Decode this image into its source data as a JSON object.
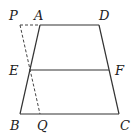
{
  "figure": {
    "type": "geometry-trapezoid",
    "points": {
      "P": {
        "label": "P",
        "x": 20,
        "y": 25,
        "lx": 9,
        "ly": 20
      },
      "A": {
        "label": "A",
        "x": 40,
        "y": 25,
        "lx": 34,
        "ly": 20
      },
      "D": {
        "label": "D",
        "x": 99,
        "y": 25,
        "lx": 99,
        "ly": 20
      },
      "E": {
        "label": "E",
        "x": 29,
        "y": 70,
        "lx": 9,
        "ly": 75
      },
      "F": {
        "label": "F",
        "x": 109,
        "y": 70,
        "lx": 115,
        "ly": 75
      },
      "B": {
        "label": "B",
        "x": 20,
        "y": 114,
        "lx": 10,
        "ly": 130
      },
      "Q": {
        "label": "Q",
        "x": 40,
        "y": 114,
        "lx": 37,
        "ly": 130
      },
      "C": {
        "label": "C",
        "x": 119,
        "y": 114,
        "lx": 120,
        "ly": 130
      }
    },
    "solid_segments": [
      [
        "A",
        "D"
      ],
      [
        "D",
        "C"
      ],
      [
        "C",
        "B"
      ],
      [
        "B",
        "A"
      ],
      [
        "E",
        "F"
      ]
    ],
    "dashed_segments": [
      [
        "P",
        "A"
      ],
      [
        "P",
        "Q"
      ]
    ]
  }
}
